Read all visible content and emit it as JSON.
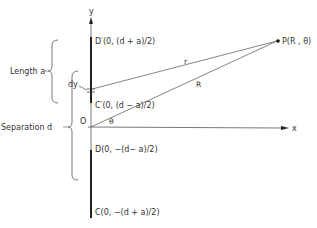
{
  "diagram": {
    "axes": {
      "y_label": "y",
      "x_label": "x",
      "origin_label": "O"
    },
    "points": {
      "D_prime": "D′(0, (d + a)/2)",
      "C_prime": "C′(0, (d − a)/2)",
      "D": "D(0, −(d− a)/2)",
      "C": "C(0, −(d + a)/2)",
      "P": "P(R , θ)"
    },
    "labels": {
      "length": "Length a",
      "separation": "Separation d",
      "dy": "dy",
      "r": "r",
      "R": "R",
      "theta": "θ"
    },
    "colors": {
      "line": "#555555",
      "rod": "#222222",
      "text": "#333333"
    }
  }
}
